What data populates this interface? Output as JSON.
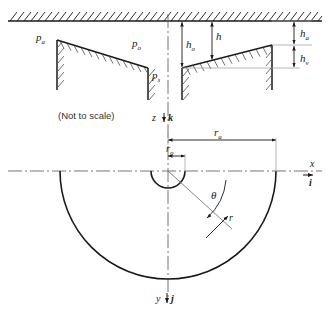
{
  "figure": {
    "note": "(Not to scale)",
    "line_color": "#1a1a1a",
    "thin_color": "#555555",
    "axis_color": "#444444"
  },
  "section_view": {
    "pressures": [
      {
        "name": "ambient-pressure",
        "label": "p",
        "sub": "a"
      },
      {
        "name": "supply-pressure-outer",
        "label": "p",
        "sub": "o"
      },
      {
        "name": "supply-pressure-s",
        "label": "p",
        "sub": "s"
      }
    ],
    "heights": [
      {
        "name": "film-height-nominal",
        "label": "h",
        "sub": "o"
      },
      {
        "name": "film-height",
        "label": "h",
        "sub": ""
      },
      {
        "name": "height-a",
        "label": "h",
        "sub": "a"
      },
      {
        "name": "height-v",
        "label": "h",
        "sub": "v"
      }
    ]
  },
  "plan_view": {
    "radii": [
      {
        "name": "inner-radius",
        "label": "r",
        "sub": "o"
      },
      {
        "name": "outer-radius",
        "label": "r",
        "sub": "a"
      },
      {
        "name": "radial-coordinate",
        "label": "r",
        "sub": ""
      }
    ],
    "angle": {
      "name": "theta-angle",
      "label": "θ"
    }
  },
  "axes": [
    {
      "name": "axis-z",
      "label": "z",
      "unit_vector": "k"
    },
    {
      "name": "axis-x",
      "label": "x",
      "unit_vector": "i"
    },
    {
      "name": "axis-y",
      "label": "y",
      "unit_vector": "j"
    }
  ]
}
